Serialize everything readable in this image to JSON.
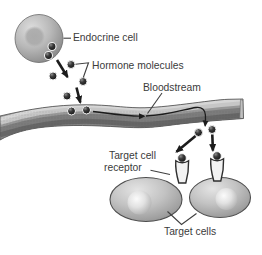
{
  "diagram": {
    "labels": {
      "endocrine_cell": "Endocrine cell",
      "hormone_molecules": "Hormone molecules",
      "bloodstream": "Bloodstream",
      "target_cell_receptor_line1": "Target cell",
      "target_cell_receptor_line2": "receptor",
      "target_cells": "Target cells"
    },
    "colors": {
      "background": "#ffffff",
      "label_text": "#3b3b3b",
      "arrow_black": "#1c1c1c",
      "cell_gray": "#b5b5b5",
      "vessel_gray": "#8f8f8f",
      "molecule_dark": "#1e1e1e",
      "receptor_fill": "#f2f2f2"
    }
  }
}
